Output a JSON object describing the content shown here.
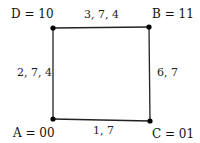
{
  "nodes": {
    "D": {
      "label": "D = 10",
      "x": 53,
      "y": 28
    },
    "B": {
      "label": "B = 11",
      "x": 149,
      "y": 27
    },
    "A": {
      "label": "A = 00",
      "x": 53,
      "y": 119
    },
    "C": {
      "label": "C = 01",
      "x": 150,
      "y": 121
    }
  },
  "edges": {
    "top": {
      "from": "D",
      "to": "B",
      "label": "3, 7, 4"
    },
    "left": {
      "from": "A",
      "to": "D",
      "label": "2, 7, 4"
    },
    "right": {
      "from": "B",
      "to": "C",
      "label": "6, 7"
    },
    "bottom": {
      "from": "A",
      "to": "C",
      "label": "1, 7"
    }
  },
  "colors": {
    "line": "#222222",
    "node": "#000000",
    "text": "#111111"
  }
}
